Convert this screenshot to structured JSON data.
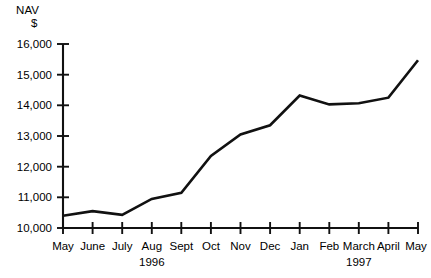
{
  "chart_data": {
    "type": "line",
    "title": "NAV\n$",
    "title_lines": [
      "NAV",
      "$"
    ],
    "xlabel": "",
    "ylabel": "NAV $",
    "categories": [
      "May",
      "June",
      "July",
      "Aug",
      "Sept",
      "Oct",
      "Nov",
      "Dec",
      "Jan",
      "Feb",
      "March",
      "April",
      "May"
    ],
    "values": [
      10400,
      10550,
      10430,
      10950,
      11150,
      12350,
      13050,
      13350,
      14320,
      14030,
      14070,
      14250,
      15470
    ],
    "series": [
      {
        "name": "NAV",
        "values": [
          10400,
          10550,
          10430,
          10950,
          11150,
          12350,
          13050,
          13350,
          14320,
          14030,
          14070,
          14250,
          15470
        ]
      }
    ],
    "ylim": [
      10000,
      16000
    ],
    "ytick_values": [
      10000,
      11000,
      12000,
      13000,
      14000,
      15000,
      16000
    ],
    "ytick_labels": [
      "10,000",
      "11,000",
      "12,000",
      "13,000",
      "14,000",
      "15,000",
      "16,000"
    ],
    "xtick_labels": [
      "May",
      "June",
      "July",
      "Aug",
      "Sept",
      "Oct",
      "Nov",
      "Dec",
      "Jan",
      "Feb",
      "March",
      "April",
      "May"
    ],
    "year_annotations": [
      {
        "label": "1996",
        "at_category": "Aug",
        "index": 3
      },
      {
        "label": "1997",
        "at_category": "March",
        "index": 10
      }
    ],
    "grid": false,
    "legend": false,
    "legend_position": "none",
    "line_color": "#111111",
    "axis_color": "#111111",
    "background_color": "#ffffff"
  }
}
